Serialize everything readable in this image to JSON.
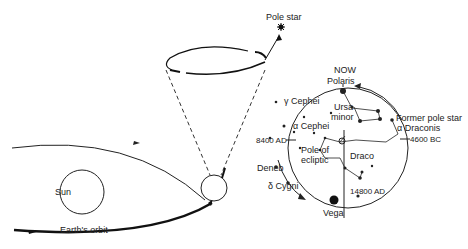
{
  "diagram": {
    "left": {
      "sun_label": "Sun",
      "orbit_label": "Earth's orbit",
      "pole_star_label": "Pole star"
    },
    "right": {
      "now_label": "NOW",
      "polaris_label": "Polaris",
      "gamma_cephei_label": "γ Cephei",
      "alpha_cephei_label": "α Cephei",
      "ursa_minor_label_1": "Ursa",
      "ursa_minor_label_2": "minor",
      "former_pole_star_label": "Former pole star",
      "alpha_draconis_label": "α Draconis",
      "bc4600_label": "4600 BC",
      "ad8400_label": "8400 AD",
      "pole_ecliptic_label_1": "Pole of",
      "pole_ecliptic_label_2": "ecliptic",
      "draco_label": "Draco",
      "deneb_label": "Deneb",
      "delta_cygni_label": "δ Cygni",
      "ad14800_label": "14800 AD",
      "vega_label": "Vega"
    }
  }
}
